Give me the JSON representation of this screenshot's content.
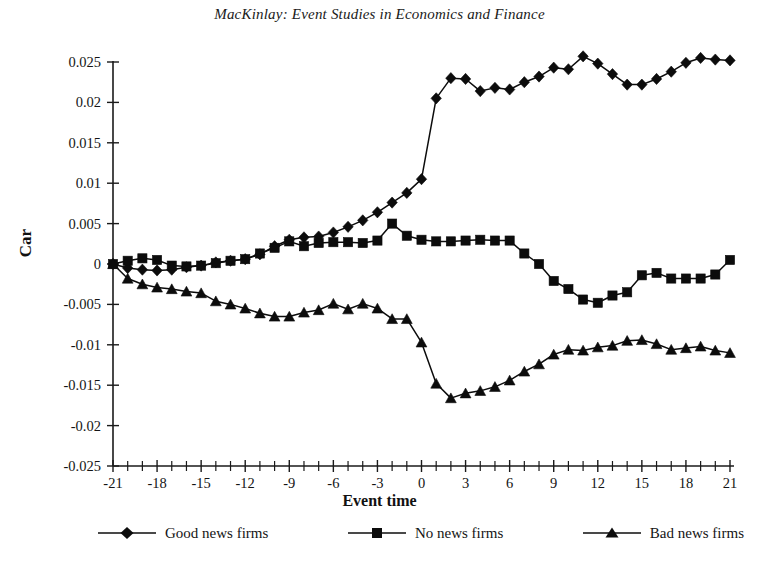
{
  "chart_data": {
    "type": "line",
    "title": "MacKinlay: Event Studies in Economics and Finance",
    "xlabel": "Event time",
    "ylabel": "Car",
    "xlim": [
      -21,
      21
    ],
    "ylim": [
      -0.025,
      0.025
    ],
    "grid": false,
    "legend_position": "bottom",
    "x_ticks_major": [
      -21,
      -18,
      -15,
      -12,
      -9,
      -6,
      -3,
      0,
      3,
      6,
      9,
      12,
      15,
      18,
      21
    ],
    "x_tick_labels": [
      "-21",
      "-18",
      "-15",
      "-12",
      "-9",
      "-6",
      "-3",
      "0",
      "3",
      "6",
      "9",
      "12",
      "15",
      "18",
      "21"
    ],
    "x_tick_step_minor": 1,
    "y_ticks": [
      0.025,
      0.02,
      0.015,
      0.01,
      0.005,
      0,
      -0.005,
      -0.01,
      -0.015,
      -0.02,
      -0.025
    ],
    "y_tick_labels": [
      "0.025",
      "0.02",
      "0.015",
      "0.01",
      "0.005",
      "0",
      "-0.005",
      "-0.01",
      "-0.015",
      "-0.02",
      "-0.025"
    ],
    "x": [
      -21,
      -20,
      -19,
      -18,
      -17,
      -16,
      -15,
      -14,
      -13,
      -12,
      -11,
      -10,
      -9,
      -8,
      -7,
      -6,
      -5,
      -4,
      -3,
      -2,
      -1,
      0,
      1,
      2,
      3,
      4,
      5,
      6,
      7,
      8,
      9,
      10,
      11,
      12,
      13,
      14,
      15,
      16,
      17,
      18,
      19,
      20,
      21
    ],
    "series": [
      {
        "name": "Good news firms",
        "marker": "diamond",
        "values": [
          0.0,
          -0.0005,
          -0.0007,
          -0.0008,
          -0.0007,
          -0.0004,
          -0.0002,
          0.0002,
          0.0004,
          0.0006,
          0.0012,
          0.0022,
          0.003,
          0.0033,
          0.0034,
          0.0039,
          0.0046,
          0.0054,
          0.0064,
          0.0076,
          0.0088,
          0.0105,
          0.0205,
          0.023,
          0.0229,
          0.0214,
          0.0218,
          0.0216,
          0.0225,
          0.0232,
          0.0243,
          0.0241,
          0.0257,
          0.0248,
          0.0235,
          0.0222,
          0.0222,
          0.0229,
          0.0238,
          0.0249,
          0.0255,
          0.0253,
          0.0252
        ]
      },
      {
        "name": "No news firms",
        "marker": "square",
        "values": [
          0.0,
          0.0004,
          0.0007,
          0.0005,
          -0.0002,
          -0.0003,
          -0.0002,
          0.0001,
          0.0004,
          0.0006,
          0.0013,
          0.002,
          0.0028,
          0.0022,
          0.0026,
          0.0027,
          0.0027,
          0.0026,
          0.0029,
          0.005,
          0.0035,
          0.003,
          0.0028,
          0.0028,
          0.0029,
          0.003,
          0.0029,
          0.0029,
          0.0013,
          0.0,
          -0.0021,
          -0.0031,
          -0.0044,
          -0.0048,
          -0.0039,
          -0.0035,
          -0.0014,
          -0.0011,
          -0.0018,
          -0.0018,
          -0.0018,
          -0.0013,
          0.0005
        ]
      },
      {
        "name": "Bad news firms",
        "marker": "triangle",
        "values": [
          0.0,
          -0.0018,
          -0.0025,
          -0.0029,
          -0.0031,
          -0.0034,
          -0.0036,
          -0.0046,
          -0.005,
          -0.0055,
          -0.0061,
          -0.0065,
          -0.0065,
          -0.006,
          -0.0057,
          -0.0049,
          -0.0056,
          -0.0049,
          -0.0055,
          -0.0068,
          -0.0068,
          -0.0097,
          -0.0148,
          -0.0166,
          -0.016,
          -0.0157,
          -0.0152,
          -0.0144,
          -0.0133,
          -0.0124,
          -0.0112,
          -0.0106,
          -0.0107,
          -0.0103,
          -0.0101,
          -0.0095,
          -0.0094,
          -0.0099,
          -0.0106,
          -0.0104,
          -0.0102,
          -0.0107,
          -0.011
        ]
      }
    ],
    "accent_color": "#0c0c0c"
  },
  "legend": {
    "items": [
      {
        "label": "Good news firms",
        "marker": "diamond-marker-icon"
      },
      {
        "label": "No news firms",
        "marker": "square-marker-icon"
      },
      {
        "label": "Bad news firms",
        "marker": "triangle-marker-icon"
      }
    ]
  }
}
